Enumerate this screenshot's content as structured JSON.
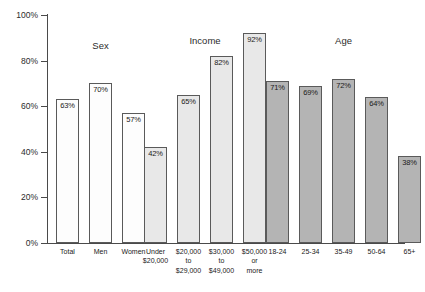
{
  "chart_data": {
    "type": "bar",
    "title": "",
    "xlabel": "",
    "ylabel": "",
    "ylim": [
      0,
      100
    ],
    "ytick_labels": [
      "0%",
      "20%",
      "40%",
      "60%",
      "80%",
      "100%"
    ],
    "ytick_values": [
      0,
      20,
      40,
      60,
      80,
      100
    ],
    "grid": false,
    "legend": "none",
    "groups": [
      {
        "name": "Sex",
        "fill": "#fdfdfd",
        "categories": [
          "Total",
          "Men",
          "Women"
        ],
        "values": [
          63,
          70,
          57
        ],
        "value_labels": [
          "63%",
          "70%",
          "57%"
        ]
      },
      {
        "name": "Income",
        "fill": "#e8e8e8",
        "categories": [
          "Under\n$20,000",
          "$20,000\nto\n$29,000",
          "$30,000\nto\n$49,000",
          "$50,000\nor\nmore"
        ],
        "values": [
          42,
          65,
          82,
          92
        ],
        "value_labels": [
          "42%",
          "65%",
          "82%",
          "92%"
        ]
      },
      {
        "name": "Age",
        "fill": "#b4b4b4",
        "categories": [
          "18-24",
          "25-34",
          "35-49",
          "50-64",
          "65+"
        ],
        "values": [
          71,
          69,
          72,
          64,
          38
        ],
        "value_labels": [
          "71%",
          "69%",
          "72%",
          "64%",
          "38%"
        ]
      }
    ]
  },
  "colors": {
    "axis": "#4a4a4a",
    "bar_border": "#5a5a5a",
    "text": "#1a1a1a",
    "fill_sex": "#fdfdfd",
    "fill_income": "#e8e8e8",
    "fill_age": "#b4b4b4"
  }
}
